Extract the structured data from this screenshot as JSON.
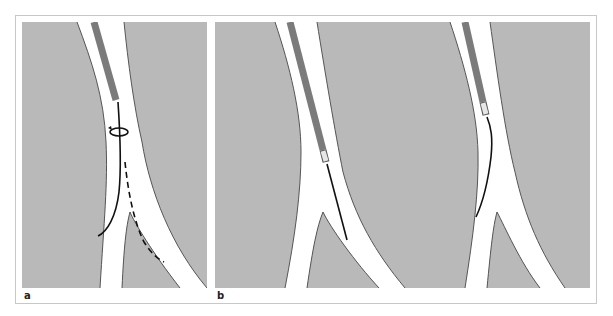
{
  "figure": {
    "panels": [
      {
        "id": "a",
        "label": "a",
        "description": "Catheter with guidewire being rotated at a vessel bifurcation; solid wire tip enters left branch, dashed path shows alternative route into right branch",
        "elements": [
          "vessel-bifurcation",
          "catheter",
          "guidewire-solid",
          "rotation-arrow",
          "guidewire-dashed-path"
        ]
      },
      {
        "id": "b",
        "label": "b",
        "description": "Two scenes: catheter with light tip and straight guidewire advancing into right branch; catheter with curved guidewire advancing into left branch",
        "elements": [
          "vessel-bifurcation",
          "catheter",
          "catheter-tip",
          "guidewire"
        ]
      }
    ]
  },
  "colors": {
    "background": "#b9b9b9",
    "vessel_lumen": "#ffffff",
    "vessel_wall": "#555555",
    "catheter": "#7b7b7b",
    "catheter_tip": "#e6e6e6",
    "guidewire": "#111111",
    "frame_border": "#c8c8c8"
  }
}
